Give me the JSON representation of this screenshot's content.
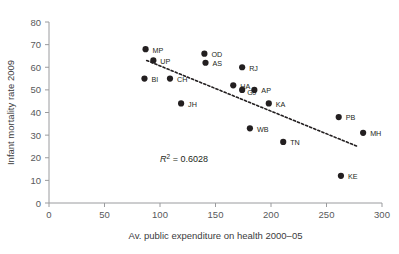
{
  "chart_data": {
    "type": "scatter",
    "title": "",
    "xlabel": "Av. public expenditure on health 2000–05",
    "ylabel": "Infant mortality rate 2009",
    "xlim": [
      0,
      300
    ],
    "ylim": [
      0,
      80
    ],
    "xticks": [
      "0",
      "50",
      "100",
      "150",
      "200",
      "250",
      "300"
    ],
    "yticks": [
      "0",
      "10",
      "20",
      "30",
      "40",
      "50",
      "60",
      "70",
      "80"
    ],
    "grid": false,
    "legend": null,
    "annotations": [
      {
        "name": "r-squared",
        "prefix": "R",
        "sup": "2",
        "text": " = 0.6028",
        "x": 100,
        "y": 18
      }
    ],
    "trendline": {
      "type": "linear-dashed",
      "x_start": 88,
      "y_start": 63,
      "x_end": 278,
      "y_end": 25
    },
    "points": [
      {
        "label": "MP",
        "x": 87,
        "y": 68,
        "label_dx": 7,
        "label_dy": 1
      },
      {
        "label": "UP",
        "x": 94,
        "y": 63,
        "label_dx": 7,
        "label_dy": 1
      },
      {
        "label": "BI",
        "x": 86,
        "y": 55,
        "label_dx": 7,
        "label_dy": 1
      },
      {
        "label": "CH",
        "x": 109,
        "y": 55,
        "label_dx": 7,
        "label_dy": 1
      },
      {
        "label": "JH",
        "x": 119,
        "y": 44,
        "label_dx": 7,
        "label_dy": 1
      },
      {
        "label": "OD",
        "x": 140,
        "y": 66,
        "label_dx": 7,
        "label_dy": 1
      },
      {
        "label": "AS",
        "x": 141,
        "y": 62,
        "label_dx": 7,
        "label_dy": 1
      },
      {
        "label": "RJ",
        "x": 174,
        "y": 60,
        "label_dx": 7,
        "label_dy": 1
      },
      {
        "label": "HA",
        "x": 166,
        "y": 52,
        "label_dx": 7,
        "label_dy": 1
      },
      {
        "label": "GJ",
        "x": 174,
        "y": 50,
        "label_dx": 5,
        "label_dy": 3
      },
      {
        "label": "AP",
        "x": 185,
        "y": 50,
        "label_dx": 7,
        "label_dy": 1
      },
      {
        "label": "KA",
        "x": 198,
        "y": 44,
        "label_dx": 7,
        "label_dy": 1
      },
      {
        "label": "WB",
        "x": 181,
        "y": 33,
        "label_dx": 7,
        "label_dy": 1
      },
      {
        "label": "TN",
        "x": 211,
        "y": 27,
        "label_dx": 7,
        "label_dy": 1
      },
      {
        "label": "PB",
        "x": 261,
        "y": 38,
        "label_dx": 7,
        "label_dy": 1
      },
      {
        "label": "MH",
        "x": 283,
        "y": 31,
        "label_dx": 7,
        "label_dy": 1
      },
      {
        "label": "KE",
        "x": 263,
        "y": 12,
        "label_dx": 7,
        "label_dy": 1
      }
    ]
  }
}
